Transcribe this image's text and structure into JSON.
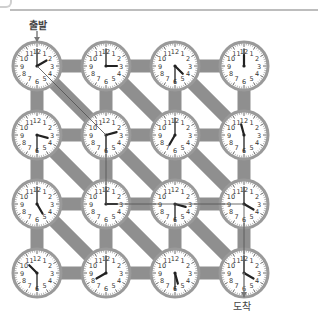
{
  "labels": {
    "start": "출발",
    "end": "도착"
  },
  "colors": {
    "connector": "#8f8f8f",
    "clock_rim": "#9a9a9a",
    "clock_face": "#ffffff",
    "hand": "#222222",
    "path_line": "#555555",
    "rule": "#bdbdbd"
  },
  "grid": {
    "rows": 4,
    "cols": 4,
    "origin_x": 37,
    "origin_y": 66,
    "spacing_x": 69,
    "spacing_y": 69,
    "clock_radius": 24
  },
  "clocks": [
    {
      "row": 0,
      "col": 0,
      "time": "2:00"
    },
    {
      "row": 0,
      "col": 1,
      "time": "3:00"
    },
    {
      "row": 0,
      "col": 2,
      "time": "4:30"
    },
    {
      "row": 0,
      "col": 3,
      "time": "12:00"
    },
    {
      "row": 1,
      "col": 0,
      "time": "3:30"
    },
    {
      "row": 1,
      "col": 1,
      "time": "2:30"
    },
    {
      "row": 1,
      "col": 2,
      "time": "7:00"
    },
    {
      "row": 1,
      "col": 3,
      "time": "11:30"
    },
    {
      "row": 2,
      "col": 0,
      "time": "5:00"
    },
    {
      "row": 2,
      "col": 1,
      "time": "3:00"
    },
    {
      "row": 2,
      "col": 2,
      "time": "3:30"
    },
    {
      "row": 2,
      "col": 3,
      "time": "4:00"
    },
    {
      "row": 3,
      "col": 0,
      "time": "10:30"
    },
    {
      "row": 3,
      "col": 1,
      "time": "8:00"
    },
    {
      "row": 3,
      "col": 2,
      "time": "5:30"
    },
    {
      "row": 3,
      "col": 3,
      "time": "4:00"
    }
  ],
  "connectors": {
    "horizontal": true,
    "vertical": true,
    "diagonal_down_right": true
  },
  "solution_path": [
    [
      0,
      0
    ],
    [
      1,
      1
    ],
    [
      2,
      1
    ],
    [
      2,
      2
    ],
    [
      2,
      3
    ],
    [
      3,
      3
    ]
  ]
}
